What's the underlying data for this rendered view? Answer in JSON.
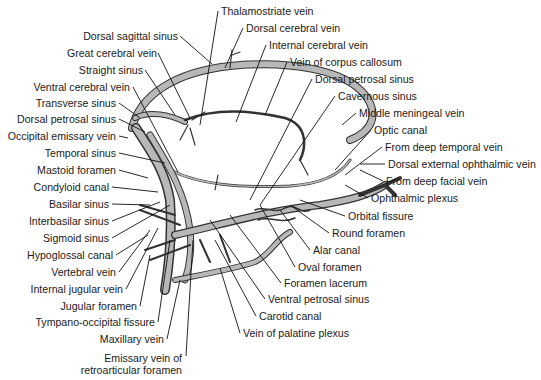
{
  "diagram": {
    "labels_left": [
      {
        "text": "Dorsal sagittal sinus",
        "x": 178,
        "y": 30
      },
      {
        "text": "Great cerebral vein",
        "x": 157,
        "y": 47
      },
      {
        "text": "Straight sinus",
        "x": 143,
        "y": 64
      },
      {
        "text": "Ventral cerebral vein",
        "x": 130,
        "y": 81
      },
      {
        "text": "Transverse sinus",
        "x": 116,
        "y": 97
      },
      {
        "text": "Dorsal petrosal sinus",
        "x": 116,
        "y": 113
      },
      {
        "text": "Occipital emissary vein",
        "x": 116,
        "y": 130
      },
      {
        "text": "Temporal sinus",
        "x": 116,
        "y": 147
      },
      {
        "text": "Mastoid foramen",
        "x": 116,
        "y": 164
      },
      {
        "text": "Condyloid canal",
        "x": 109,
        "y": 181
      },
      {
        "text": "Basilar sinus",
        "x": 109,
        "y": 198
      },
      {
        "text": "Interbasilar sinus",
        "x": 109,
        "y": 215
      },
      {
        "text": "Sigmoid sinus",
        "x": 109,
        "y": 232
      },
      {
        "text": "Hypoglossal canal",
        "x": 113,
        "y": 249
      },
      {
        "text": "Vertebral vein",
        "x": 116,
        "y": 266
      },
      {
        "text": "Internal jugular vein",
        "x": 123,
        "y": 283
      },
      {
        "text": "Jugular foramen",
        "x": 137,
        "y": 300
      },
      {
        "text": "Tympano-occipital fissure",
        "x": 155,
        "y": 316
      },
      {
        "text": "Maxillary vein",
        "x": 164,
        "y": 333
      },
      {
        "text": "Emissary vein of",
        "x": 182,
        "y": 352
      },
      {
        "text": "retroarticular foramen",
        "x": 182,
        "y": 364
      }
    ],
    "labels_top_right": [
      {
        "text": "Thalamostriate vein",
        "x": 221,
        "y": 5
      },
      {
        "text": "Dorsal cerebral vein",
        "x": 246,
        "y": 22
      },
      {
        "text": "Internal cerebral vein",
        "x": 269,
        "y": 39
      },
      {
        "text": "Vein of corpus callosum",
        "x": 290,
        "y": 56
      },
      {
        "text": "Dorsal petrosal sinus",
        "x": 315,
        "y": 73
      },
      {
        "text": "Cavernous sinus",
        "x": 338,
        "y": 90
      },
      {
        "text": "Middle meningeal vein",
        "x": 359,
        "y": 107
      },
      {
        "text": "Optic canal",
        "x": 374,
        "y": 124
      },
      {
        "text": "From deep temporal vein",
        "x": 385,
        "y": 141
      },
      {
        "text": "Dorsal external ophthalmic vein",
        "x": 388,
        "y": 158
      },
      {
        "text": "From deep facial vein",
        "x": 386,
        "y": 175
      },
      {
        "text": "Ophthalmic plexus",
        "x": 371,
        "y": 192
      }
    ],
    "labels_bottom_right": [
      {
        "text": "Orbital fissure",
        "x": 348,
        "y": 210
      },
      {
        "text": "Round foramen",
        "x": 332,
        "y": 227
      },
      {
        "text": "Alar canal",
        "x": 313,
        "y": 244
      },
      {
        "text": "Oval foramen",
        "x": 298,
        "y": 261
      },
      {
        "text": "Foramen lacerum",
        "x": 284,
        "y": 277
      },
      {
        "text": "Ventral petrosal sinus",
        "x": 268,
        "y": 293
      },
      {
        "text": "Carotid canal",
        "x": 259,
        "y": 310
      },
      {
        "text": "Vein of palatine plexus",
        "x": 243,
        "y": 327
      }
    ]
  }
}
